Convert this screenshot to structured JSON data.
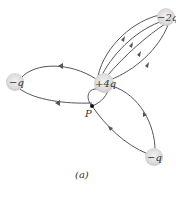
{
  "figure": {
    "caption": "(a)",
    "point_label": "P",
    "charges": [
      {
        "id": "center",
        "label": "+4q",
        "x": 104,
        "y": 83
      },
      {
        "id": "top-right",
        "label": "−2q",
        "x": 166,
        "y": 17
      },
      {
        "id": "left",
        "label": "−q",
        "x": 15,
        "y": 82
      },
      {
        "id": "bottom-right",
        "label": "−q",
        "x": 154,
        "y": 157
      }
    ],
    "colors": {
      "field_line": "#555555",
      "charge_fill": "#d9d9d9",
      "text": "#333333"
    }
  }
}
